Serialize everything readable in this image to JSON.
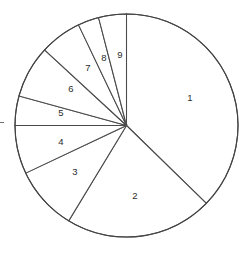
{
  "chart_data": {
    "type": "pie",
    "title": "",
    "subtitle": "",
    "xlabel": "",
    "ylabel": "",
    "legend_position": "none",
    "grid": false,
    "labels_inside_slices": true,
    "start_angle_deg_from_north": 0,
    "direction": "clockwise",
    "center_px": {
      "x": 126.5,
      "y": 125.5
    },
    "radius_px": 111.5,
    "stroke_color": "#4a4a4a",
    "fill_color": "#ffffff",
    "categories": [
      "1",
      "2",
      "3",
      "4",
      "5",
      "6",
      "7",
      "8",
      "9"
    ],
    "values": [
      134.3,
      76.9,
      33.5,
      25.3,
      15.4,
      27.3,
      21.8,
      11.0,
      14.5
    ],
    "value_unit": "degrees",
    "percentages": [
      37.3,
      21.4,
      9.3,
      7.0,
      4.3,
      7.6,
      6.1,
      3.1,
      4.0
    ],
    "slices": [
      {
        "label": "1",
        "start_deg": 0.0,
        "end_deg": 134.3,
        "sweep_deg": 134.3,
        "percent": 37.3,
        "label_pos": {
          "x": 190,
          "y": 98
        }
      },
      {
        "label": "2",
        "start_deg": 134.3,
        "end_deg": 211.2,
        "sweep_deg": 76.9,
        "percent": 21.4,
        "label_pos": {
          "x": 135,
          "y": 196
        }
      },
      {
        "label": "3",
        "start_deg": 211.2,
        "end_deg": 244.7,
        "sweep_deg": 33.5,
        "percent": 9.3,
        "label_pos": {
          "x": 75,
          "y": 172
        }
      },
      {
        "label": "4",
        "start_deg": 244.7,
        "end_deg": 270.0,
        "sweep_deg": 25.3,
        "percent": 7.0,
        "label_pos": {
          "x": 61,
          "y": 142
        }
      },
      {
        "label": "5",
        "start_deg": 270.0,
        "end_deg": 285.4,
        "sweep_deg": 15.4,
        "percent": 4.3,
        "label_pos": {
          "x": 61,
          "y": 113
        }
      },
      {
        "label": "6",
        "start_deg": 285.4,
        "end_deg": 312.7,
        "sweep_deg": 27.3,
        "percent": 7.6,
        "label_pos": {
          "x": 71,
          "y": 89
        }
      },
      {
        "label": "7",
        "start_deg": 312.7,
        "end_deg": 334.5,
        "sweep_deg": 21.8,
        "percent": 6.1,
        "label_pos": {
          "x": 88,
          "y": 68
        }
      },
      {
        "label": "8",
        "start_deg": 334.5,
        "end_deg": 345.5,
        "sweep_deg": 11.0,
        "percent": 3.1,
        "label_pos": {
          "x": 104,
          "y": 58
        }
      },
      {
        "label": "9",
        "start_deg": 345.5,
        "end_deg": 360.0,
        "sweep_deg": 14.5,
        "percent": 4.0,
        "label_pos": {
          "x": 120,
          "y": 55
        }
      }
    ],
    "annotations": []
  }
}
